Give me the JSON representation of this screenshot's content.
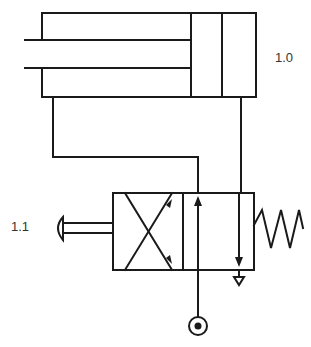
{
  "diagram": {
    "type": "pneumatic-circuit",
    "components": [
      {
        "id": "1.0",
        "label": "1.0",
        "kind": "single-acting-cylinder"
      },
      {
        "id": "1.1",
        "label": "1.1",
        "kind": "3/2-way-valve-pushbutton-spring-return"
      }
    ],
    "connections": [
      {
        "from": "1.1 output",
        "to": "1.0 rod-side port"
      },
      {
        "from": "1.0 cap-side port",
        "to": "1.1 exhaust"
      },
      {
        "from": "pressure-source",
        "to": "1.1 supply"
      }
    ],
    "colors": {
      "line": "#1a1a1a",
      "label": "#333333",
      "background": "#ffffff"
    }
  }
}
